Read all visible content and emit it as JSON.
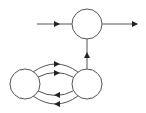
{
  "diagram": {
    "type": "state-transition",
    "stroke_color": "#555555",
    "fill_color": "#ffffff",
    "nodes": [
      {
        "id": "top",
        "cx": 87,
        "cy": 24,
        "r": 15,
        "label": ""
      },
      {
        "id": "bottom-left",
        "cx": 25,
        "cy": 84,
        "r": 15,
        "label": ""
      },
      {
        "id": "bottom-right",
        "cx": 87,
        "cy": 84,
        "r": 15,
        "label": ""
      }
    ],
    "edges": [
      {
        "from": "input",
        "to": "top",
        "label": ""
      },
      {
        "from": "top",
        "to": "output",
        "label": ""
      },
      {
        "from": "bottom-right",
        "to": "top",
        "label": ""
      },
      {
        "from": "bottom-left",
        "to": "bottom-right",
        "label": "",
        "count": 2
      },
      {
        "from": "bottom-right",
        "to": "bottom-left",
        "label": "",
        "count": 2
      }
    ]
  }
}
